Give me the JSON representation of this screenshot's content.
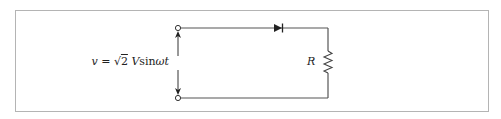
{
  "diagram": {
    "type": "circuit",
    "source_label": {
      "var": "v",
      "eq": " = ",
      "sqrt_sym": "√",
      "sqrt_arg": "2",
      "rest": " V",
      "func": "sin",
      "arg": "ωt"
    },
    "resistor_label": "R",
    "components": [
      {
        "id": "terminal-top",
        "kind": "terminal"
      },
      {
        "id": "terminal-bottom",
        "kind": "terminal"
      },
      {
        "id": "diode",
        "kind": "diode",
        "direction": "right"
      },
      {
        "id": "resistor",
        "kind": "resistor",
        "label": "R"
      }
    ],
    "colors": {
      "wire": "#555555",
      "frame": "#b4b4b4",
      "text": "#222222"
    }
  }
}
